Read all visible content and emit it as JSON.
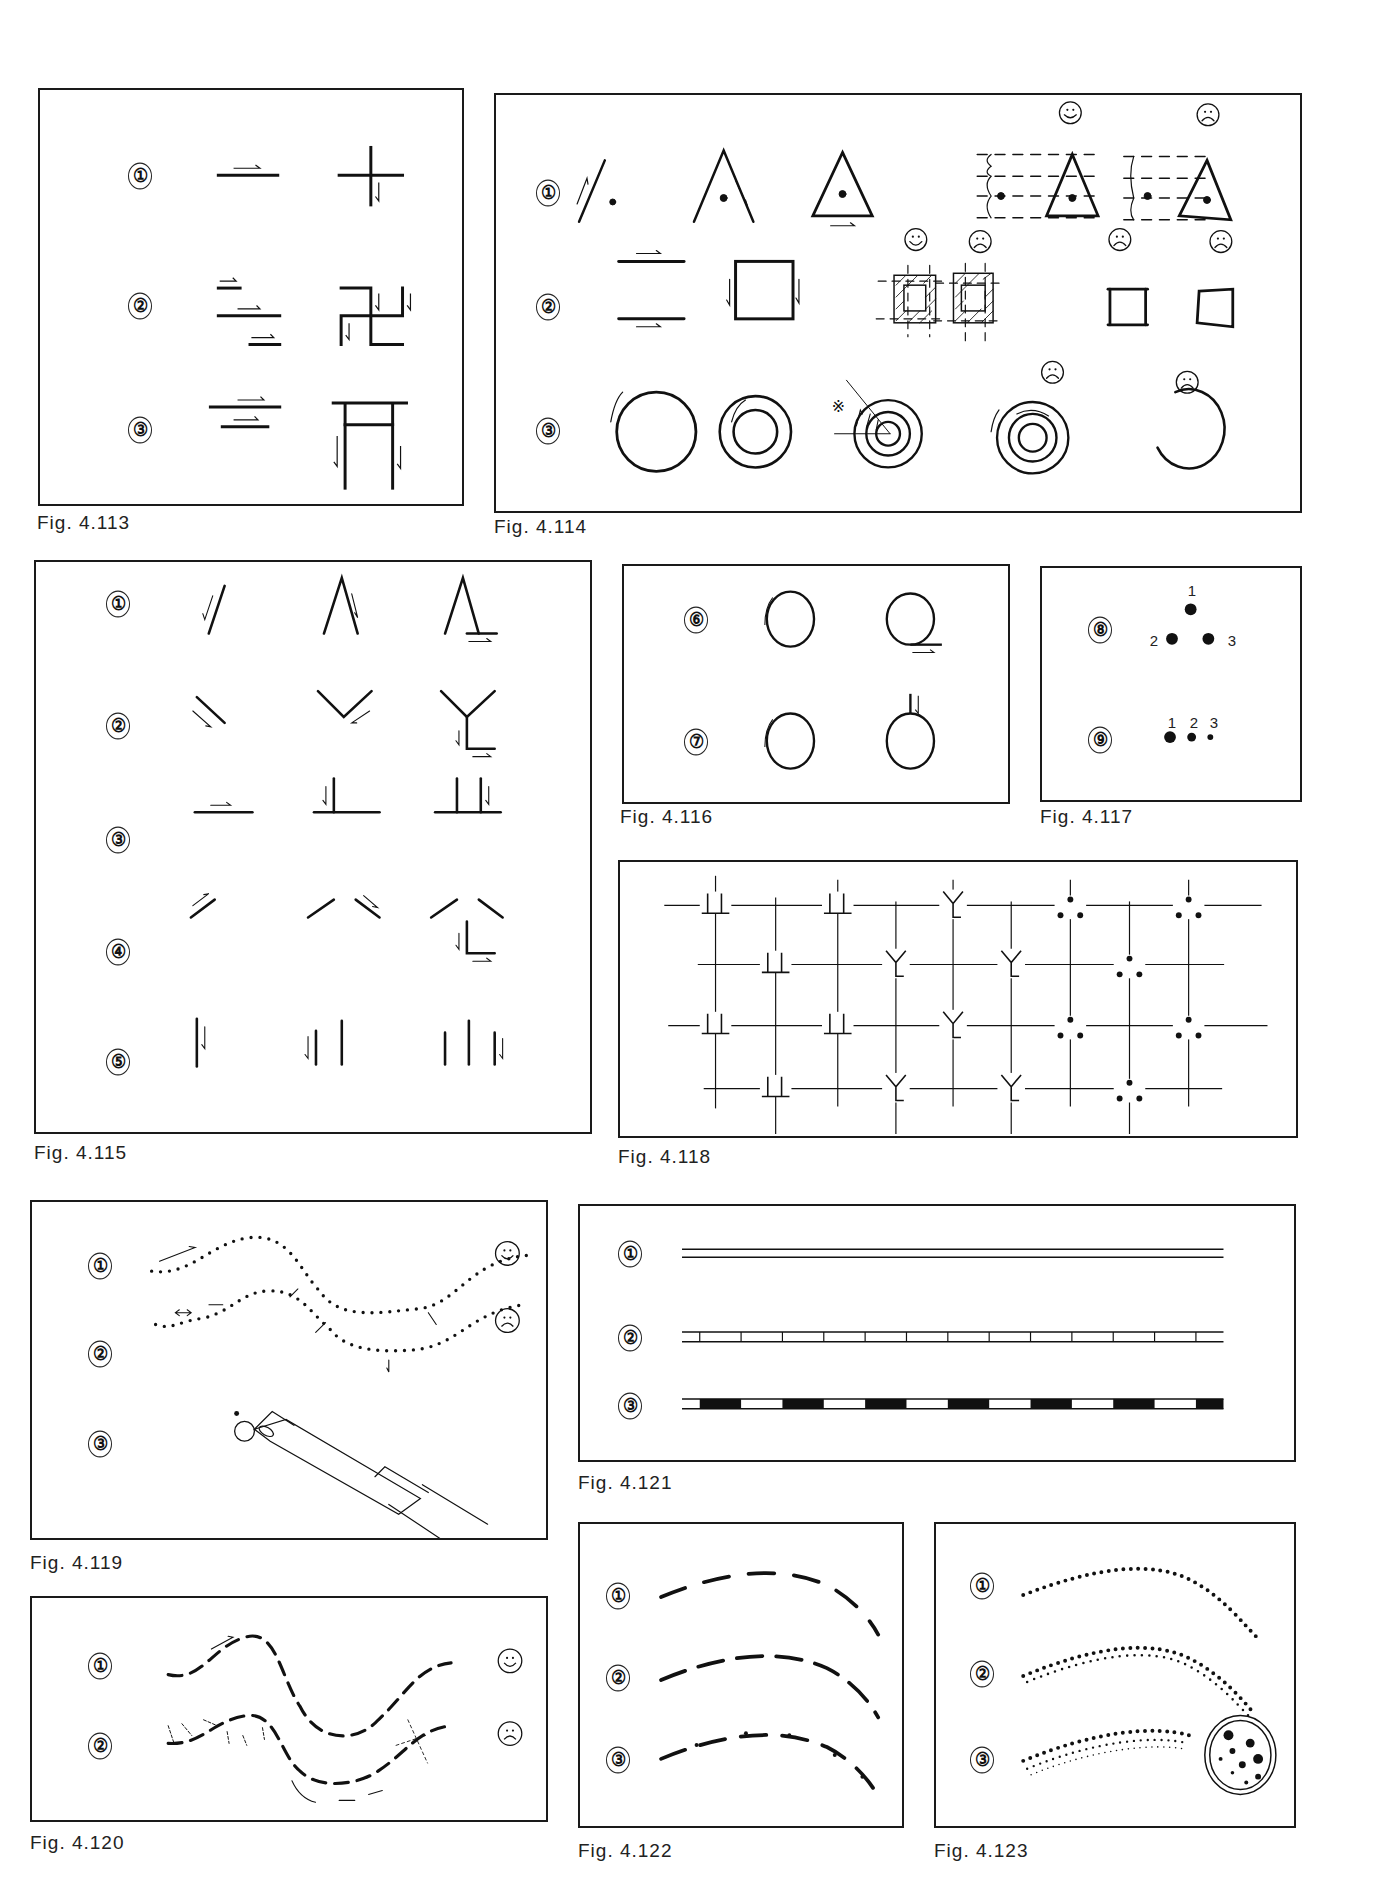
{
  "page": {
    "figures": [
      {
        "id": "fig-4-113",
        "caption": "Fig. 4.113",
        "rows": [
          "①",
          "②",
          "③"
        ]
      },
      {
        "id": "fig-4-114",
        "caption": "Fig. 4.114",
        "rows": [
          "①",
          "②",
          "③"
        ],
        "symbols": {
          "good": "☺",
          "bad": "☹",
          "note": "※"
        }
      },
      {
        "id": "fig-4-115",
        "caption": "Fig. 4.115",
        "rows": [
          "①",
          "②",
          "③",
          "④",
          "⑤"
        ]
      },
      {
        "id": "fig-4-116",
        "caption": "Fig. 4.116",
        "rows": [
          "⑥",
          "⑦"
        ]
      },
      {
        "id": "fig-4-117",
        "caption": "Fig. 4.117",
        "rows": [
          "⑧",
          "⑨"
        ],
        "dot_labels_8": [
          "1",
          "2",
          "3"
        ],
        "dot_labels_9": [
          "1",
          "2",
          "3"
        ]
      },
      {
        "id": "fig-4-118",
        "caption": "Fig. 4.118"
      },
      {
        "id": "fig-4-119",
        "caption": "Fig. 4.119",
        "rows": [
          "①",
          "②",
          "③"
        ],
        "symbols": {
          "good": "☺",
          "bad": "☹"
        }
      },
      {
        "id": "fig-4-120",
        "caption": "Fig. 4.120",
        "rows": [
          "①",
          "②"
        ],
        "symbols": {
          "good": "☺",
          "bad": "☹"
        }
      },
      {
        "id": "fig-4-121",
        "caption": "Fig. 4.121",
        "rows": [
          "①",
          "②",
          "③"
        ]
      },
      {
        "id": "fig-4-122",
        "caption": "Fig. 4.122",
        "rows": [
          "①",
          "②",
          "③"
        ]
      },
      {
        "id": "fig-4-123",
        "caption": "Fig. 4.123",
        "rows": [
          "①",
          "②",
          "③"
        ]
      }
    ]
  }
}
